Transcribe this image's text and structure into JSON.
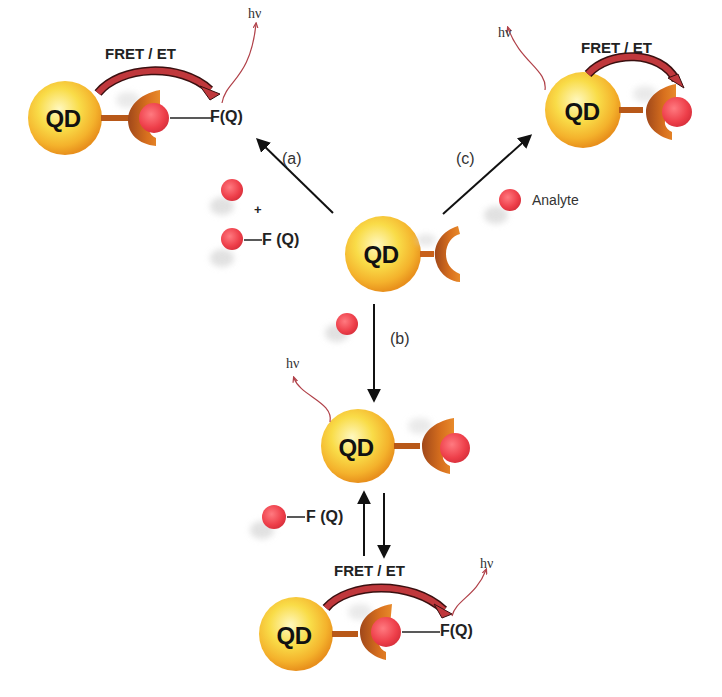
{
  "diagram": {
    "colors": {
      "qd_core": "#F7D640",
      "qd_rim": "#F0A020",
      "receptor": "#C8601A",
      "analyte": "#E8404A",
      "fret_arrow": "#C0383C",
      "emission": "#B04048",
      "arrow": "#111111"
    },
    "center": {
      "qd_label": "QD"
    },
    "steps": {
      "a": "(a)",
      "b": "(b)",
      "c": "(c)"
    },
    "reagents": {
      "plus": "+",
      "fq_label": "F (Q)",
      "analyte_label": "Analyte"
    },
    "pathway_a": {
      "qd_label": "QD",
      "fret_label": "FRET / ET",
      "emission_label": "hν",
      "fq_label": "F(Q)"
    },
    "pathway_c": {
      "qd_label": "QD",
      "fret_label": "FRET / ET",
      "emission_label": "hν"
    },
    "pathway_b": {
      "qd_label": "QD",
      "emission_label": "hν",
      "fq_label": "F (Q)"
    },
    "pathway_b2": {
      "qd_label": "QD",
      "fret_label": "FRET / ET",
      "emission_label": "hν",
      "fq_label": "F(Q)"
    }
  }
}
